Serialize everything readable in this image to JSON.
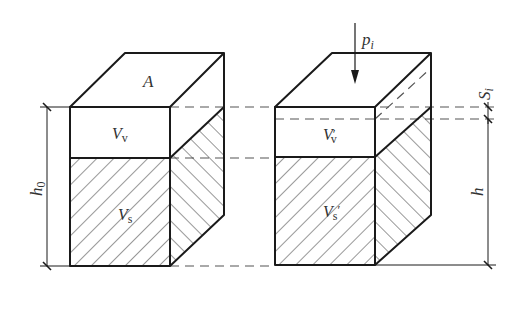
{
  "diagram": {
    "type": "soil compression schematic",
    "colors": {
      "line": "#1a1a1a",
      "dash": "#555555",
      "background": "#ffffff"
    },
    "left_block": {
      "top_label": "A",
      "void_label": "V",
      "void_sub": "v",
      "solid_label": "V",
      "solid_sub": "s",
      "height_label": "h",
      "height_sub": "0"
    },
    "right_block": {
      "load_label": "p",
      "load_sub": "i",
      "void_label": "V",
      "void_sub": "v",
      "void_prime": "′",
      "solid_label": "V",
      "solid_sub": "s",
      "solid_prime": "′",
      "settlement_label": "S",
      "settlement_sub": "i",
      "height_label": "h"
    }
  }
}
